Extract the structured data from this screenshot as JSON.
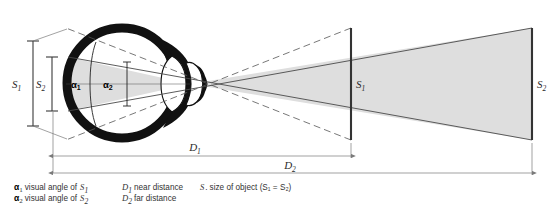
{
  "figure": {
    "labels": {
      "retinal_s1": "S",
      "retinal_s1_sub": "1",
      "retinal_s2": "S",
      "retinal_s2_sub": "2",
      "angle_1": "α",
      "angle_1_sub": "1",
      "angle_2": "α",
      "angle_2_sub": "2",
      "object_near": "S",
      "object_near_sub": "1",
      "object_far": "S",
      "object_far_sub": "2",
      "distance_near": "D",
      "distance_near_sub": "1",
      "distance_far": "D",
      "distance_far_sub": "2"
    },
    "legend": {
      "column1": [
        {
          "symbol": "α",
          "symbol_sub": "1",
          "text": "visual angle of",
          "trailing_symbol": "S",
          "trailing_sub": "1"
        },
        {
          "symbol": "α",
          "symbol_sub": "2",
          "text": "visual angle of",
          "trailing_symbol": "S",
          "trailing_sub": "2"
        }
      ],
      "column2": [
        {
          "symbol": "D",
          "symbol_sub": "1",
          "text": "near distance"
        },
        {
          "symbol": "D",
          "symbol_sub": "2",
          "text": "far distance"
        }
      ],
      "column3": [
        {
          "symbol": "S",
          "symbol_sub": ".",
          "text": "size of object (S₁ = S₂)"
        }
      ]
    },
    "colors": {
      "fan_shade": "#dedede",
      "eye_outline": "#111111",
      "ray_line": "#4a4a4a",
      "dimension_line": "#7a7a7a",
      "background": "#ffffff"
    },
    "geometry": {
      "nodal_point_x": 190,
      "nodal_point_y": 84,
      "near_object_x": 351,
      "far_object_x": 532,
      "object_top_y": 28,
      "object_bottom_y": 140
    }
  }
}
